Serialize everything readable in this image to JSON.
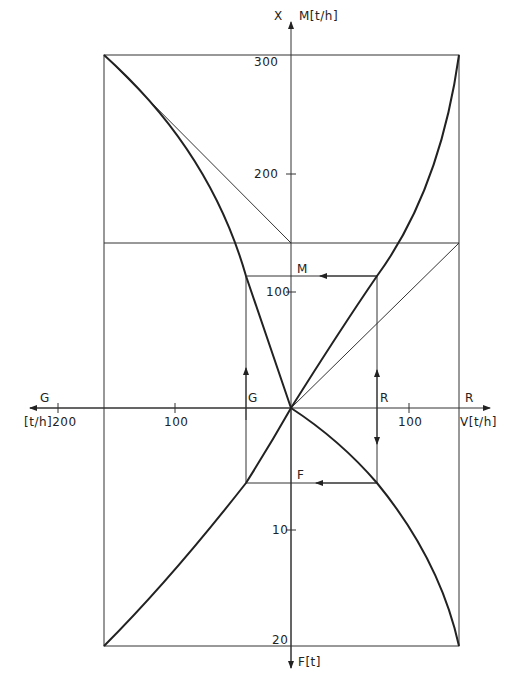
{
  "diagram": {
    "axes": {
      "up": {
        "label_left": "X",
        "label_right": "M[t/h]",
        "ticks": [
          "300",
          "200",
          "100"
        ]
      },
      "down": {
        "label": "F[t]",
        "ticks": [
          "10",
          "20"
        ]
      },
      "left": {
        "label_top": "G",
        "label_bottom": "[t/h]200",
        "ticks": [
          "100"
        ]
      },
      "right": {
        "label_bottom": "V[t/h]",
        "label_top": "R",
        "ticks": [
          "100"
        ]
      }
    },
    "inner_labels": {
      "M": "M",
      "F": "F",
      "G": "G",
      "R": "R"
    },
    "colors": {
      "line": "#222222",
      "background": "#ffffff"
    }
  }
}
